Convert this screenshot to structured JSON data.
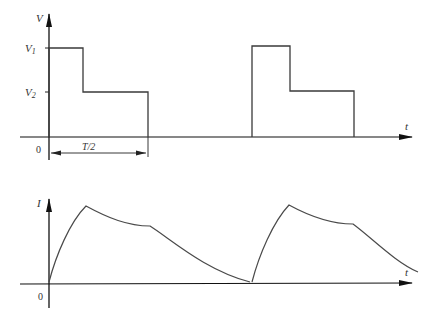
{
  "diagram": {
    "top_plot": {
      "y_axis_label": "V",
      "x_axis_label": "t",
      "origin_label": "0",
      "levels": [
        {
          "label": "V",
          "sub": "1"
        },
        {
          "label": "V",
          "sub": "2"
        }
      ],
      "dimension_label": "T/2",
      "waveform": "two-level stepped voltage pulse (V1 then V2) repeated with period T"
    },
    "bottom_plot": {
      "y_axis_label": "I",
      "x_axis_label": "t",
      "origin_label": "0",
      "waveform": "current response: rises to peak, decays during V2, then falls to zero; repeats"
    },
    "colors": {
      "line": "#3a3a3a",
      "axis": "#1a1a1a",
      "background": "#ffffff"
    }
  }
}
